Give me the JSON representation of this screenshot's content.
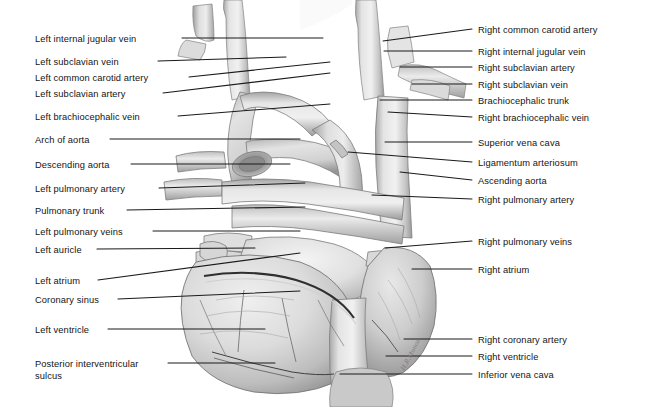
{
  "figure": {
    "signature": "H.R.Munoz",
    "background_color": "#ffffff",
    "leader_color": "#1a1a1a",
    "palette": {
      "vessel_light": "#e9e9e9",
      "vessel_mid": "#cfcfcf",
      "vessel_dark": "#9d9d9d",
      "muscle_light": "#e2e2e2",
      "muscle_mid": "#c2c2c2",
      "muscle_dark": "#8d8d8d",
      "outline": "#6f6f6f",
      "coronary": "#3a3a3a"
    }
  },
  "left_labels": [
    {
      "text": "Left internal jugular vein",
      "x": 35,
      "y": 34,
      "lx": 182,
      "ly": 38,
      "tx": 323,
      "ty": 38
    },
    {
      "text": "Left subclavian vein",
      "x": 35,
      "y": 57,
      "lx": 158,
      "ly": 61,
      "tx": 286,
      "ty": 57
    },
    {
      "text": "Left common carotid artery",
      "x": 35,
      "y": 73,
      "lx": 189,
      "ly": 77,
      "tx": 330,
      "ty": 62
    },
    {
      "text": "Left subclavian artery",
      "x": 35,
      "y": 89,
      "lx": 163,
      "ly": 93,
      "tx": 330,
      "ty": 73
    },
    {
      "text": "Left brachiocephalic vein",
      "x": 35,
      "y": 112,
      "lx": 178,
      "ly": 116,
      "tx": 330,
      "ty": 104
    },
    {
      "text": "Arch of aorta",
      "x": 35,
      "y": 135,
      "lx": 110,
      "ly": 139,
      "tx": 300,
      "ty": 139
    },
    {
      "text": "Descending aorta",
      "x": 35,
      "y": 160,
      "lx": 131,
      "ly": 164,
      "tx": 290,
      "ty": 164
    },
    {
      "text": "Left pulmonary artery",
      "x": 35,
      "y": 184,
      "lx": 159,
      "ly": 188,
      "tx": 305,
      "ty": 183
    },
    {
      "text": "Pulmonary trunk",
      "x": 35,
      "y": 206,
      "lx": 127,
      "ly": 210,
      "tx": 305,
      "ty": 207
    },
    {
      "text": "Left pulmonary veins",
      "x": 35,
      "y": 227,
      "lx": 153,
      "ly": 231,
      "tx": 300,
      "ty": 231
    },
    {
      "text": "Left auricle",
      "x": 35,
      "y": 245,
      "lx": 97,
      "ly": 249,
      "tx": 255,
      "ty": 248
    },
    {
      "text": "Left atrium",
      "x": 35,
      "y": 276,
      "lx": 98,
      "ly": 280,
      "tx": 300,
      "ty": 253
    },
    {
      "text": "Coronary sinus",
      "x": 35,
      "y": 295,
      "lx": 118,
      "ly": 299,
      "tx": 300,
      "ty": 291
    },
    {
      "text": "Left ventricle",
      "x": 35,
      "y": 325,
      "lx": 108,
      "ly": 329,
      "tx": 265,
      "ty": 329
    },
    {
      "text": "Posterior interventricular",
      "x": 35,
      "y": 359,
      "lx": 168,
      "ly": 363,
      "tx": 275,
      "ty": 363
    },
    {
      "text": "sulcus",
      "x": 35,
      "y": 371,
      "lx": 0,
      "ly": 0,
      "tx": 0,
      "ty": 0
    }
  ],
  "right_labels": [
    {
      "text": "Right common carotid artery",
      "x": 478,
      "y": 25,
      "lx": 472,
      "ly": 29,
      "tx": 383,
      "ty": 41
    },
    {
      "text": "Right internal jugular vein",
      "x": 478,
      "y": 47,
      "lx": 472,
      "ly": 51,
      "tx": 384,
      "ty": 51
    },
    {
      "text": "Right subclavian artery",
      "x": 478,
      "y": 63,
      "lx": 472,
      "ly": 67,
      "tx": 400,
      "ty": 67
    },
    {
      "text": "Right subclavian vein",
      "x": 478,
      "y": 80,
      "lx": 472,
      "ly": 84,
      "tx": 412,
      "ty": 84
    },
    {
      "text": "Brachiocephalic trunk",
      "x": 478,
      "y": 96,
      "lx": 472,
      "ly": 100,
      "tx": 380,
      "ty": 100
    },
    {
      "text": "Right brachiocephalic vein",
      "x": 478,
      "y": 113,
      "lx": 472,
      "ly": 117,
      "tx": 388,
      "ty": 112
    },
    {
      "text": "Superior vena cava",
      "x": 478,
      "y": 138,
      "lx": 472,
      "ly": 142,
      "tx": 385,
      "ty": 142
    },
    {
      "text": "Ligamentum arteriosum",
      "x": 478,
      "y": 158,
      "lx": 472,
      "ly": 162,
      "tx": 348,
      "ty": 152
    },
    {
      "text": "Ascending aorta",
      "x": 478,
      "y": 176,
      "lx": 472,
      "ly": 180,
      "tx": 400,
      "ty": 172
    },
    {
      "text": "Right pulmonary artery",
      "x": 478,
      "y": 195,
      "lx": 472,
      "ly": 199,
      "tx": 372,
      "ty": 195
    },
    {
      "text": "Right pulmonary veins",
      "x": 478,
      "y": 237,
      "lx": 472,
      "ly": 241,
      "tx": 385,
      "ty": 248
    },
    {
      "text": "Right atrium",
      "x": 478,
      "y": 265,
      "lx": 472,
      "ly": 269,
      "tx": 412,
      "ty": 269
    },
    {
      "text": "Right coronary artery",
      "x": 478,
      "y": 335,
      "lx": 472,
      "ly": 339,
      "tx": 404,
      "ty": 339
    },
    {
      "text": "Right ventricle",
      "x": 478,
      "y": 352,
      "lx": 472,
      "ly": 356,
      "tx": 386,
      "ty": 356
    },
    {
      "text": "Inferior vena cava",
      "x": 478,
      "y": 370,
      "lx": 472,
      "ly": 374,
      "tx": 340,
      "ty": 374
    }
  ]
}
